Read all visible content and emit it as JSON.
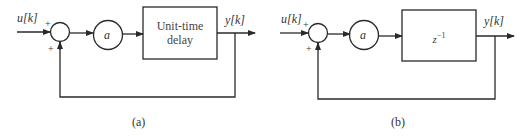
{
  "diagrams": [
    {
      "id": "a",
      "caption": "(a)",
      "input_label": "u[k]",
      "output_label": "y[k]",
      "gain_label": "a",
      "block_label": "Unit-time delay",
      "block_line1": "Unit-time",
      "block_line2": "delay",
      "sum_signs": [
        "+",
        "+"
      ]
    },
    {
      "id": "b",
      "caption": "(b)",
      "input_label": "u[k]",
      "output_label": "y[k]",
      "gain_label": "a",
      "block_label": "z^-1",
      "block_base": "z",
      "block_exp": "−1",
      "sum_signs": [
        "+",
        "+"
      ]
    }
  ],
  "colors": {
    "line": "#2a2a2a",
    "text": "#333333",
    "background": "#ffffff"
  }
}
